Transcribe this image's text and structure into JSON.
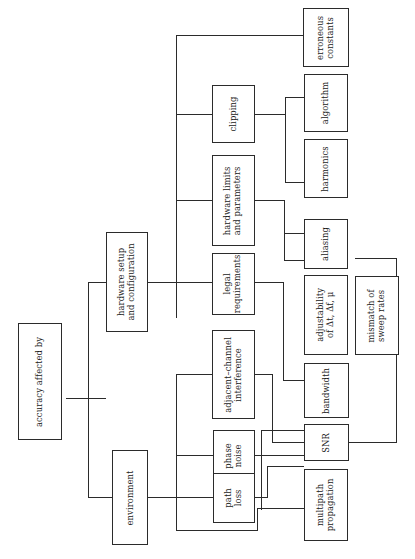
{
  "diagram": {
    "title": "accuracy affected by",
    "type": "tree",
    "orientation": "rotated-90-ccw",
    "root": {
      "id": "root",
      "label": "accuracy affected by"
    },
    "nodes": [
      {
        "id": "root",
        "label": "accuracy affected by"
      },
      {
        "id": "hw_setup",
        "label": "hardware setup\nand configuration"
      },
      {
        "id": "environment",
        "label": "environment"
      },
      {
        "id": "clipping",
        "label": "clipping"
      },
      {
        "id": "hw_limits",
        "label": "hardware limits\nand parameters"
      },
      {
        "id": "legal",
        "label": "legal\nrequirements"
      },
      {
        "id": "adjacent",
        "label": "adjacent–channel\ninterference"
      },
      {
        "id": "phase_noise",
        "label": "phase\nnoise"
      },
      {
        "id": "path_loss",
        "label": "path\nloss"
      },
      {
        "id": "err_const",
        "label": "erroneous\nconstants"
      },
      {
        "id": "algorithm",
        "label": "algorithm"
      },
      {
        "id": "harmonics",
        "label": "harmonics"
      },
      {
        "id": "aliasing",
        "label": "aliasing"
      },
      {
        "id": "adjust",
        "label": "adjustability\nof Δt, Δf, μ"
      },
      {
        "id": "mismatch",
        "label": "mismatch of\nsweep rates"
      },
      {
        "id": "bandwidth",
        "label": "bandwidth"
      },
      {
        "id": "snr",
        "label": "SNR"
      },
      {
        "id": "multipath",
        "label": "multipath\npropagation"
      }
    ],
    "edges": [
      {
        "from": "root",
        "to": "hw_setup"
      },
      {
        "from": "root",
        "to": "environment"
      },
      {
        "from": "hw_setup",
        "to": "clipping"
      },
      {
        "from": "hw_setup",
        "to": "hw_limits"
      },
      {
        "from": "hw_setup",
        "to": "legal"
      },
      {
        "from": "hw_setup",
        "to": "err_const"
      },
      {
        "from": "environment",
        "to": "adjacent"
      },
      {
        "from": "environment",
        "to": "phase_noise"
      },
      {
        "from": "environment",
        "to": "path_loss"
      },
      {
        "from": "environment",
        "to": "multipath"
      },
      {
        "from": "clipping",
        "to": "algorithm"
      },
      {
        "from": "clipping",
        "to": "harmonics"
      },
      {
        "from": "hw_limits",
        "to": "aliasing"
      },
      {
        "from": "hw_limits",
        "to": "adjust"
      },
      {
        "from": "legal",
        "to": "bandwidth"
      },
      {
        "from": "adjacent",
        "to": "snr"
      },
      {
        "from": "phase_noise",
        "to": "snr"
      },
      {
        "from": "path_loss",
        "to": "snr"
      },
      {
        "from": "multipath",
        "to": "snr"
      },
      {
        "from": "snr",
        "to": "mismatch"
      }
    ],
    "colors": {
      "box_border": "#2b2b2b",
      "edge": "#2b2b2b",
      "background": "#ffffff",
      "text": "#1a1a1a"
    }
  }
}
